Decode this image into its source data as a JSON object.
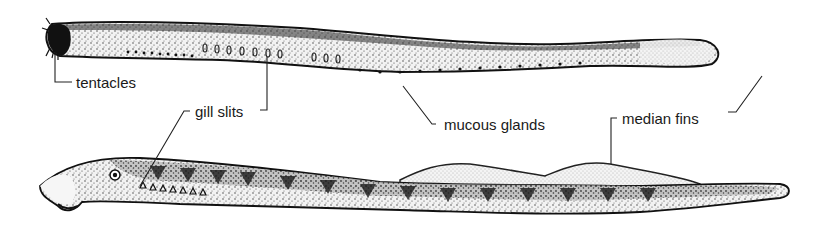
{
  "figure": {
    "subjects": [
      {
        "name": "upper-animal",
        "description": "hagfish-like eel illustration"
      },
      {
        "name": "lower-animal",
        "description": "lamprey-like eel illustration with dorsal fins"
      }
    ],
    "labels": {
      "tentacles": "tentacles",
      "gill_slits": "gill slits",
      "mucous_glands": "mucous glands",
      "median_fins": "median fins"
    },
    "colors": {
      "ink": "#1a1a1a",
      "body_fill": "#d9d9d9",
      "dark_band": "#3a3a3a",
      "fin_fill": "#e6e6e6",
      "background": "#ffffff"
    }
  }
}
